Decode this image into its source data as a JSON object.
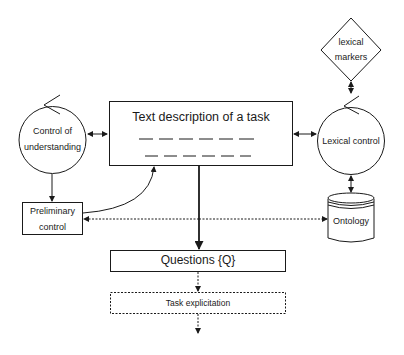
{
  "diagram": {
    "nodes": {
      "text_description": {
        "label": "Text description of a task",
        "shape": "rectangle"
      },
      "control_understanding": {
        "line1": "Control of",
        "line2": "understanding",
        "shape": "circle-with-loop-arrow"
      },
      "lexical_control": {
        "label": "Lexical control",
        "shape": "circle-with-loop-arrow"
      },
      "lexical_markers": {
        "line1": "lexical",
        "line2": "markers",
        "shape": "diamond"
      },
      "preliminary_control": {
        "line1": "Preliminary",
        "line2": "control",
        "shape": "rectangle"
      },
      "ontology": {
        "label": "Ontology",
        "shape": "cylinder"
      },
      "questions": {
        "label": "Questions {Q}",
        "shape": "rectangle"
      },
      "task_explicitation": {
        "label": "Task explicitation",
        "shape": "dashed-rectangle"
      }
    },
    "edges": [
      {
        "from": "control_understanding",
        "to": "text_description",
        "style": "solid",
        "direction": "both"
      },
      {
        "from": "text_description",
        "to": "lexical_control",
        "style": "solid",
        "direction": "both"
      },
      {
        "from": "lexical_markers",
        "to": "lexical_control",
        "style": "solid",
        "direction": "both"
      },
      {
        "from": "lexical_control",
        "to": "ontology",
        "style": "solid",
        "direction": "both"
      },
      {
        "from": "control_understanding",
        "to": "preliminary_control",
        "style": "solid",
        "direction": "forward"
      },
      {
        "from": "preliminary_control",
        "to": "text_description",
        "style": "solid-curved",
        "direction": "forward"
      },
      {
        "from": "text_description",
        "to": "questions",
        "style": "thick",
        "direction": "forward"
      },
      {
        "from": "center-line",
        "to": "preliminary_control",
        "style": "dashed",
        "direction": "forward"
      },
      {
        "from": "center-line",
        "to": "ontology",
        "style": "dashed",
        "direction": "forward"
      },
      {
        "from": "questions",
        "to": "task_explicitation",
        "style": "dashed",
        "direction": "forward"
      },
      {
        "from": "task_explicitation",
        "to": "output",
        "style": "dashed",
        "direction": "forward"
      }
    ]
  }
}
